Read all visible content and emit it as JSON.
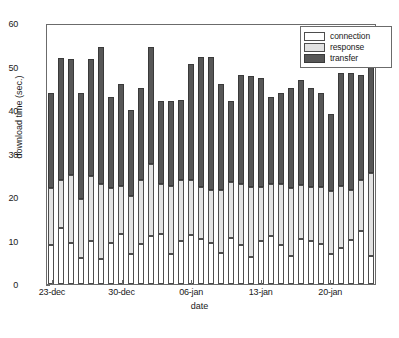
{
  "chart_data": {
    "type": "bar",
    "subtype": "stacked-bar",
    "title": "",
    "xlabel": "date",
    "ylabel": "download time (sec.)",
    "ylim": [
      0,
      60
    ],
    "yticks": [
      0,
      10,
      20,
      30,
      40,
      50,
      60
    ],
    "grid": false,
    "legend_position": "top-right",
    "colors": {
      "connection": "#ffffff",
      "response": "#e2e2e2",
      "transfer": "#575757",
      "axis": "#6b6b6b",
      "text": "#1a1a1a"
    },
    "xtick_labels": [
      "23-dec",
      "30-dec",
      "06-jan",
      "13-jan",
      "20-jan"
    ],
    "xtick_indices": [
      0,
      7,
      14,
      21,
      28
    ],
    "categories": [
      "23-dec",
      "24-dec",
      "25-dec",
      "26-dec",
      "27-dec",
      "28-dec",
      "29-dec",
      "30-dec",
      "31-dec",
      "01-jan",
      "02-jan",
      "03-jan",
      "04-jan",
      "05-jan",
      "06-jan",
      "07-jan",
      "08-jan",
      "09-jan",
      "10-jan",
      "11-jan",
      "12-jan",
      "13-jan",
      "14-jan",
      "15-jan",
      "16-jan",
      "17-jan",
      "18-jan",
      "19-jan",
      "20-jan",
      "21-jan",
      "22-jan",
      "23-jan",
      "24-jan"
    ],
    "series": [
      {
        "name": "connection",
        "values": [
          9.0,
          12.8,
          9.5,
          6.0,
          9.8,
          5.8,
          9.5,
          11.5,
          6.8,
          9.3,
          11.0,
          11.5,
          7.0,
          9.8,
          11.2,
          10.3,
          9.5,
          7.2,
          10.5,
          9.0,
          6.3,
          9.8,
          11.0,
          9.0,
          6.5,
          10.3,
          10.0,
          9.3,
          6.8,
          8.3,
          10.2,
          12.3,
          6.5
        ]
      },
      {
        "name": "response",
        "values": [
          13.0,
          11.0,
          15.5,
          13.5,
          15.0,
          17.2,
          12.5,
          11.0,
          13.5,
          14.5,
          16.5,
          11.5,
          15.5,
          14.0,
          12.8,
          12.0,
          12.2,
          14.3,
          13.0,
          14.0,
          16.0,
          12.5,
          12.0,
          14.0,
          15.5,
          12.5,
          12.3,
          13.0,
          14.5,
          14.2,
          11.5,
          11.5,
          19.0
        ]
      },
      {
        "name": "transfer",
        "values": [
          22.0,
          28.2,
          26.8,
          24.5,
          27.0,
          31.5,
          21.0,
          23.5,
          19.8,
          21.2,
          27.0,
          19.0,
          19.5,
          18.5,
          26.5,
          30.0,
          30.5,
          24.5,
          18.5,
          25.0,
          25.5,
          25.0,
          20.0,
          21.0,
          23.0,
          24.0,
          22.7,
          21.7,
          17.7,
          26.0,
          26.8,
          24.2,
          25.0
        ]
      }
    ],
    "totals": [
      44.0,
      52.0,
      51.8,
      44.0,
      51.8,
      54.5,
      43.0,
      46.0,
      40.1,
      45.0,
      54.5,
      42.0,
      42.0,
      42.3,
      50.5,
      52.3,
      52.2,
      46.0,
      42.0,
      48.0,
      47.8,
      47.3,
      43.0,
      44.0,
      45.0,
      46.8,
      45.0,
      44.0,
      39.0,
      48.5,
      48.5,
      48.0,
      50.5
    ]
  },
  "legend": {
    "items": [
      {
        "label": "connection",
        "swatch": "connection"
      },
      {
        "label": "response",
        "swatch": "response"
      },
      {
        "label": "transfer",
        "swatch": "transfer"
      }
    ]
  }
}
